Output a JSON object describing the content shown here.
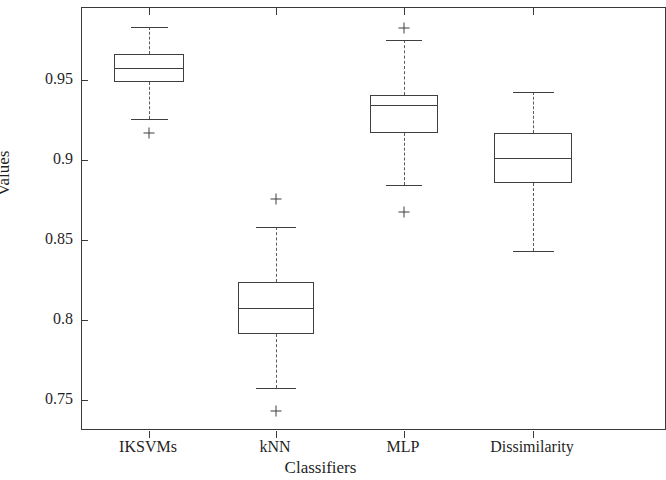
{
  "chart_data": {
    "type": "box",
    "title": "",
    "xlabel": "Classifiers",
    "ylabel": "Values",
    "categories": [
      "IKSVMs",
      "kNN",
      "MLP",
      "Dissimilarity"
    ],
    "ytick_labels": [
      "0.95",
      "0.9",
      "0.85",
      "0.8",
      "0.75"
    ],
    "ytick_values": [
      0.95,
      0.9,
      0.85,
      0.8,
      0.75
    ],
    "ylim": [
      0.7355,
      0.9997
    ],
    "grid": false,
    "legend": null,
    "boxes": [
      {
        "name": "IKSVMs",
        "whisker_low": 0.926,
        "q1": 0.9494,
        "median": 0.9581,
        "q3": 0.9669,
        "whisker_high": 0.9838,
        "outliers": [
          0.9175
        ]
      },
      {
        "name": "kNN",
        "whisker_low": 0.7581,
        "q1": 0.7919,
        "median": 0.8081,
        "q3": 0.8244,
        "whisker_high": 0.8588,
        "outliers": [
          0.8763,
          0.7438
        ]
      },
      {
        "name": "MLP",
        "whisker_low": 0.885,
        "q1": 0.9175,
        "median": 0.935,
        "q3": 0.9413,
        "whisker_high": 0.9756,
        "outliers": [
          0.9831,
          0.8681
        ]
      },
      {
        "name": "Dissimilarity",
        "whisker_low": 0.8438,
        "q1": 0.8863,
        "median": 0.9019,
        "q3": 0.9175,
        "whisker_high": 0.9431,
        "outliers": []
      }
    ]
  }
}
